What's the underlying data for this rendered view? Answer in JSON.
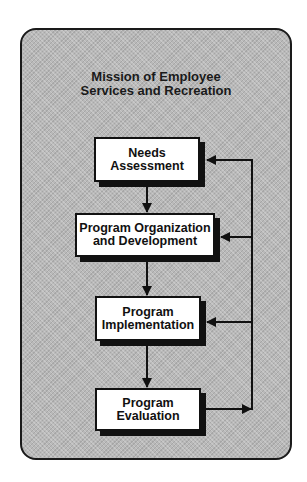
{
  "diagram": {
    "title_lines": [
      "Mission of Employee",
      "Services and Recreation"
    ],
    "nodes": [
      {
        "id": "needs-assessment",
        "lines": [
          "Needs",
          "Assessment"
        ]
      },
      {
        "id": "program-organization",
        "lines": [
          "Program Organization",
          "and Development"
        ]
      },
      {
        "id": "program-implementation",
        "lines": [
          "Program",
          "Implementation"
        ]
      },
      {
        "id": "program-evaluation",
        "lines": [
          "Program",
          "Evaluation"
        ]
      }
    ],
    "edges": [
      {
        "from": "needs-assessment",
        "to": "program-organization",
        "type": "sequence"
      },
      {
        "from": "program-organization",
        "to": "program-implementation",
        "type": "sequence"
      },
      {
        "from": "program-implementation",
        "to": "program-evaluation",
        "type": "sequence"
      },
      {
        "from": "program-evaluation",
        "to": "needs-assessment",
        "type": "feedback"
      },
      {
        "from": "program-evaluation",
        "to": "program-organization",
        "type": "feedback"
      },
      {
        "from": "program-evaluation",
        "to": "program-implementation",
        "type": "feedback"
      }
    ],
    "colors": {
      "background": "#b9b9b9",
      "box_fill": "#ffffff",
      "stroke": "#111111"
    }
  }
}
